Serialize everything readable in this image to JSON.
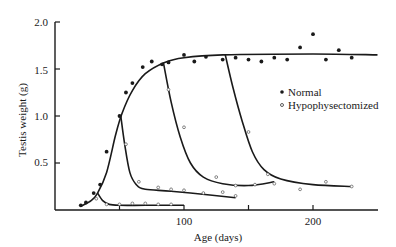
{
  "chart_data": {
    "type": "scatter",
    "title": "",
    "xlabel": "Age (days)",
    "ylabel": "Testis weight (g)",
    "xlim": [
      0,
      250
    ],
    "ylim": [
      0,
      2.0
    ],
    "grid": false,
    "legend_position": "right-middle",
    "x_ticks": [
      {
        "value": 50,
        "label": ""
      },
      {
        "value": 100,
        "label": "100"
      },
      {
        "value": 150,
        "label": ""
      },
      {
        "value": 200,
        "label": "200"
      }
    ],
    "y_ticks": [
      {
        "value": 0.5,
        "label": "0.5"
      },
      {
        "value": 1.0,
        "label": "1.0"
      },
      {
        "value": 1.5,
        "label": "1.5"
      },
      {
        "value": 2.0,
        "label": "2.0"
      }
    ],
    "legend": [
      {
        "name": "Normal",
        "marker": "filled-circle"
      },
      {
        "name": "Hypophysectomized",
        "marker": "open-circle"
      }
    ],
    "series": [
      {
        "name": "Normal",
        "marker": "filled-circle",
        "points": [
          {
            "x": 20,
            "y": 0.05
          },
          {
            "x": 24,
            "y": 0.08
          },
          {
            "x": 30,
            "y": 0.18
          },
          {
            "x": 35,
            "y": 0.27
          },
          {
            "x": 40,
            "y": 0.62
          },
          {
            "x": 50,
            "y": 1.0
          },
          {
            "x": 55,
            "y": 1.25
          },
          {
            "x": 60,
            "y": 1.35
          },
          {
            "x": 68,
            "y": 1.52
          },
          {
            "x": 75,
            "y": 1.58
          },
          {
            "x": 83,
            "y": 1.55
          },
          {
            "x": 88,
            "y": 1.57
          },
          {
            "x": 100,
            "y": 1.65
          },
          {
            "x": 108,
            "y": 1.58
          },
          {
            "x": 117,
            "y": 1.63
          },
          {
            "x": 130,
            "y": 1.6
          },
          {
            "x": 140,
            "y": 1.62
          },
          {
            "x": 150,
            "y": 1.6
          },
          {
            "x": 160,
            "y": 1.58
          },
          {
            "x": 170,
            "y": 1.62
          },
          {
            "x": 180,
            "y": 1.6
          },
          {
            "x": 190,
            "y": 1.73
          },
          {
            "x": 200,
            "y": 1.87
          },
          {
            "x": 210,
            "y": 1.6
          },
          {
            "x": 220,
            "y": 1.7
          },
          {
            "x": 230,
            "y": 1.62
          }
        ]
      },
      {
        "name": "Hypophysectomized",
        "marker": "open-circle",
        "points": [
          {
            "x": 32,
            "y": 0.12
          },
          {
            "x": 40,
            "y": 0.06
          },
          {
            "x": 50,
            "y": 0.06
          },
          {
            "x": 60,
            "y": 0.07
          },
          {
            "x": 70,
            "y": 0.07
          },
          {
            "x": 80,
            "y": 0.06
          },
          {
            "x": 90,
            "y": 0.06
          },
          {
            "x": 55,
            "y": 0.7
          },
          {
            "x": 65,
            "y": 0.3
          },
          {
            "x": 80,
            "y": 0.24
          },
          {
            "x": 90,
            "y": 0.22
          },
          {
            "x": 100,
            "y": 0.21
          },
          {
            "x": 115,
            "y": 0.18
          },
          {
            "x": 130,
            "y": 0.19
          },
          {
            "x": 140,
            "y": 0.15
          },
          {
            "x": 88,
            "y": 1.28
          },
          {
            "x": 100,
            "y": 0.88
          },
          {
            "x": 125,
            "y": 0.35
          },
          {
            "x": 140,
            "y": 0.26
          },
          {
            "x": 155,
            "y": 0.27
          },
          {
            "x": 150,
            "y": 0.83
          },
          {
            "x": 165,
            "y": 0.38
          },
          {
            "x": 170,
            "y": 0.28
          },
          {
            "x": 190,
            "y": 0.22
          },
          {
            "x": 210,
            "y": 0.3
          },
          {
            "x": 230,
            "y": 0.25
          }
        ]
      }
    ],
    "fitted_curves": [
      {
        "name": "Normal growth curve",
        "points": [
          [
            20,
            0.04
          ],
          [
            28,
            0.1
          ],
          [
            33,
            0.18
          ],
          [
            40,
            0.4
          ],
          [
            47,
            0.8
          ],
          [
            52,
            1.03
          ],
          [
            60,
            1.27
          ],
          [
            70,
            1.45
          ],
          [
            85,
            1.57
          ],
          [
            100,
            1.62
          ],
          [
            130,
            1.65
          ],
          [
            200,
            1.66
          ],
          [
            250,
            1.65
          ]
        ]
      },
      {
        "name": "Hypophysectomized at ~33 days",
        "points": [
          [
            33,
            0.18
          ],
          [
            37,
            0.1
          ],
          [
            42,
            0.06
          ],
          [
            50,
            0.05
          ],
          [
            70,
            0.05
          ],
          [
            100,
            0.05
          ]
        ]
      },
      {
        "name": "Hypophysectomized at ~50 days",
        "points": [
          [
            51,
            1.0
          ],
          [
            54,
            0.7
          ],
          [
            58,
            0.4
          ],
          [
            63,
            0.27
          ],
          [
            70,
            0.22
          ],
          [
            90,
            0.2
          ],
          [
            120,
            0.16
          ],
          [
            140,
            0.13
          ]
        ]
      },
      {
        "name": "Hypophysectomized at ~85 days",
        "points": [
          [
            84,
            1.57
          ],
          [
            90,
            1.15
          ],
          [
            97,
            0.78
          ],
          [
            105,
            0.5
          ],
          [
            115,
            0.35
          ],
          [
            130,
            0.28
          ],
          [
            150,
            0.26
          ],
          [
            170,
            0.3
          ]
        ]
      },
      {
        "name": "Hypophysectomized at ~132 days",
        "points": [
          [
            132,
            1.65
          ],
          [
            138,
            1.3
          ],
          [
            145,
            0.95
          ],
          [
            153,
            0.62
          ],
          [
            162,
            0.43
          ],
          [
            175,
            0.33
          ],
          [
            200,
            0.27
          ],
          [
            230,
            0.25
          ]
        ]
      }
    ]
  },
  "labels": {
    "x_axis_title": "Age (days)",
    "y_axis_title": "Testis weight (g)",
    "legend_normal": "Normal",
    "legend_hypo": "Hypophysectomized",
    "tick_x_100": "100",
    "tick_x_200": "200",
    "tick_y_05": "0.5",
    "tick_y_10": "1.0",
    "tick_y_15": "1.5",
    "tick_y_20": "2.0"
  }
}
